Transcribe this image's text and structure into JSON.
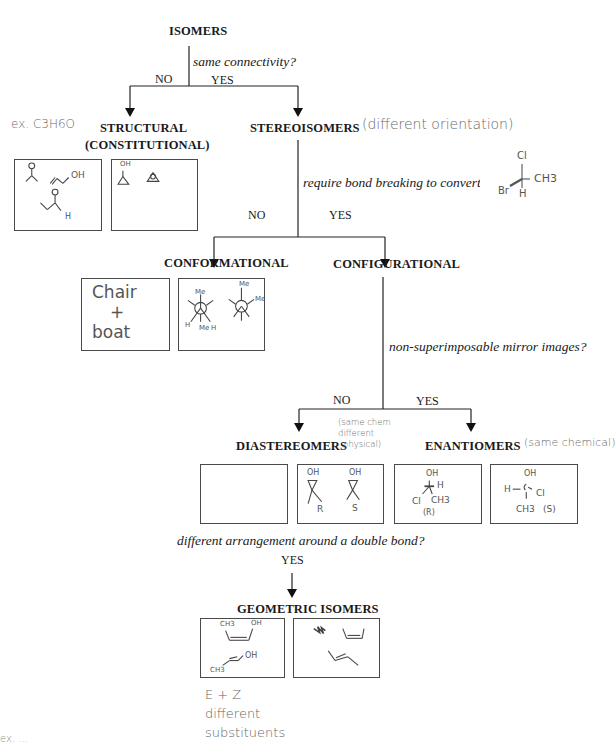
{
  "title": "ISOMERS",
  "question_1": {
    "text": "same connectivity?",
    "no_label": "NO",
    "yes_label": "YES"
  },
  "structural": {
    "title": "STRUCTURAL",
    "subtitle": "(CONSTITUTIONAL)",
    "note": "ex. C3H6O",
    "box1_labels": [
      "OH",
      "H"
    ],
    "box2_labels": [
      "OH"
    ]
  },
  "stereoisomers": {
    "title": "STEREOISOMERS",
    "note": "(different orientation)"
  },
  "question_2": {
    "text": "require bond breaking to convert?",
    "no_label": "NO",
    "yes_label": "YES",
    "sketch_labels": [
      "Cl",
      "CH3",
      "Br",
      "H"
    ]
  },
  "conformational": {
    "title": "CONFORMATIONAL",
    "box1_lines": [
      "Chair",
      "+",
      "boat"
    ],
    "box2_labels": [
      "Me",
      "Me",
      "Me",
      "Me",
      "H",
      "H"
    ]
  },
  "configurational": {
    "title": "CONFIGURATIONAL"
  },
  "question_3": {
    "text": "non-superimposable mirror images?",
    "no_label": "NO",
    "yes_label": "YES"
  },
  "diastereomers": {
    "title": "DIASTEREOMERS",
    "note_lines": [
      "(same chem",
      "different",
      "physical)"
    ],
    "box2_labels": [
      "OH",
      "OH",
      "R",
      "S"
    ]
  },
  "enantiomers": {
    "title": "ENANTIOMERS",
    "note": "(same chemical)",
    "box1_labels": [
      "OH",
      "H",
      "Cl",
      "CH3",
      "(R)"
    ],
    "box2_labels": [
      "OH",
      "H",
      "Cl",
      "CH3",
      "(S)"
    ]
  },
  "question_4": {
    "text": "different arrangement around a double bond?",
    "yes_label": "YES"
  },
  "geometric": {
    "title": "GEOMETRIC ISOMERS",
    "box1_labels": [
      "CH3",
      "OH",
      "CH3",
      "OH"
    ],
    "note_lines": [
      "E + Z",
      "different",
      "substituents"
    ]
  },
  "bottom_left_note": "ex. ..."
}
